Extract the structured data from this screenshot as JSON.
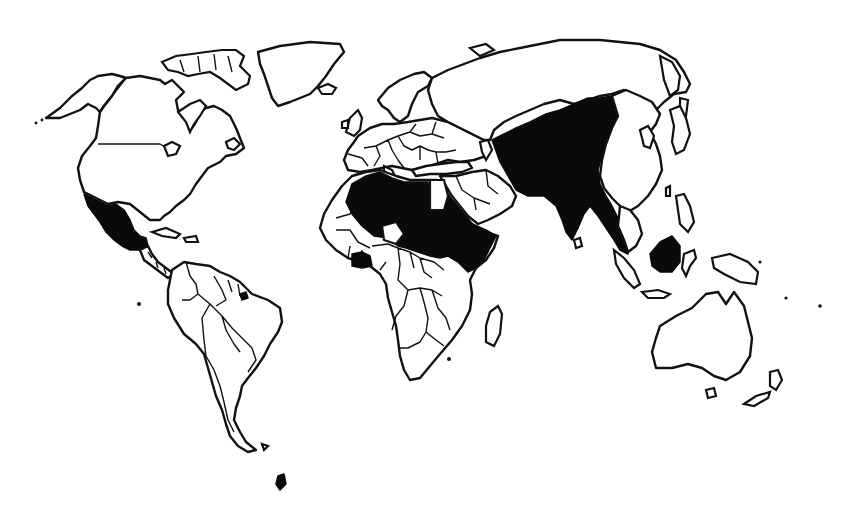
{
  "map": {
    "type": "world-outline-choropleth",
    "background": "#ffffff",
    "outline_color": "#111111",
    "shaded_color": "#0a0a0a",
    "unshaded_color": "#ffffff",
    "legend": null,
    "labels": []
  },
  "shaded_regions": [
    {
      "id": "mexico",
      "name": "Mexico"
    },
    {
      "id": "algeria-niger-libya-sahel",
      "name": "Algeria / Libya / Niger / Chad / Sudan (Sahara–Sahel belt)"
    },
    {
      "id": "mali-mauritania",
      "name": "Mali"
    },
    {
      "id": "ethiopia-somalia",
      "name": "Ethiopia / Somalia (Horn of Africa)"
    },
    {
      "id": "west-africa-coast",
      "name": "Ghana / Côte d'Ivoire region"
    },
    {
      "id": "south-asia-china-west",
      "name": "Afghanistan / Pakistan / India / Western China / Mongolia"
    },
    {
      "id": "mainland-southeast-asia",
      "name": "Myanmar / Thailand / Malay Peninsula"
    },
    {
      "id": "borneo",
      "name": "Borneo"
    },
    {
      "id": "sulawesi-fragment",
      "name": "Sulawesi"
    }
  ],
  "unshaded_regions": [
    "North America (USA, Canada, Alaska, Greenland)",
    "Central America & Caribbean",
    "South America",
    "Europe",
    "Russia",
    "Egypt",
    "Middle East / Arabian Peninsula",
    "Southern & Central Africa",
    "Madagascar",
    "East Asia (eastern China, Korea, Japan)",
    "Indochina east coast",
    "Sumatra, Philippines, New Guinea",
    "Australia",
    "New Zealand"
  ]
}
